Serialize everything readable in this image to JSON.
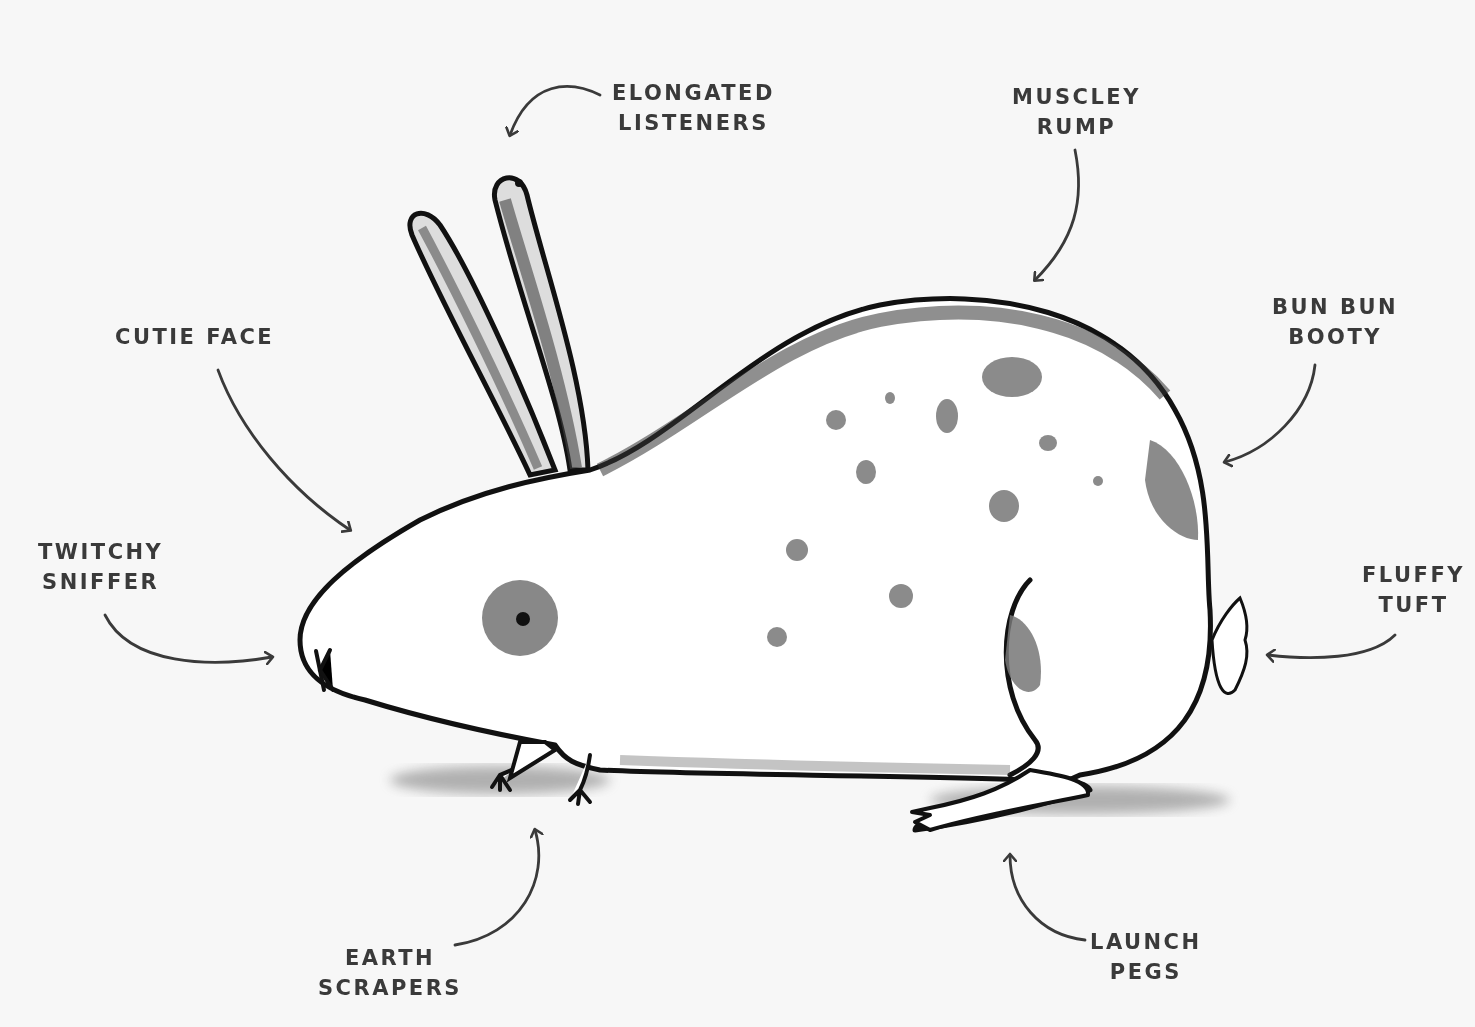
{
  "diagram": {
    "background_color": "#f7f7f7",
    "ink_color": "#1a1a1a",
    "spot_color": "#8a8a8a",
    "label_color": "#3a3a3a",
    "labels": [
      {
        "id": "ears",
        "line1": "elongated",
        "line2": "listeners",
        "points_to": "ears"
      },
      {
        "id": "rump",
        "line1": "muscley",
        "line2": "rump",
        "points_to": "back"
      },
      {
        "id": "booty",
        "line1": "bun bun",
        "line2": "booty",
        "points_to": "hindquarters"
      },
      {
        "id": "face",
        "line1": "cutie face",
        "line2": "",
        "points_to": "face"
      },
      {
        "id": "nose",
        "line1": "twitchy",
        "line2": "sniffer",
        "points_to": "nose"
      },
      {
        "id": "tail",
        "line1": "fluffy",
        "line2": "tuft",
        "points_to": "tail"
      },
      {
        "id": "front",
        "line1": "earth",
        "line2": "scrapers",
        "points_to": "front paws"
      },
      {
        "id": "hind",
        "line1": "launch",
        "line2": "pegs",
        "points_to": "hind foot"
      }
    ]
  }
}
